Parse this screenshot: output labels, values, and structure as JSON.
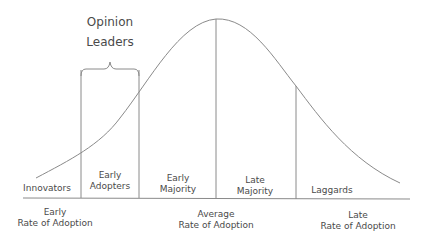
{
  "diagram": {
    "colors": {
      "line": "#8a8a8a",
      "text": "#4a4a4a",
      "background": "#ffffff"
    },
    "bracket": {
      "label_line1": "Opinion",
      "label_line2": "Leaders"
    },
    "segments": [
      {
        "line1": "Innovators",
        "line2": ""
      },
      {
        "line1": "Early",
        "line2": "Adopters"
      },
      {
        "line1": "Early",
        "line2": "Majority"
      },
      {
        "line1": "Late",
        "line2": "Majority"
      },
      {
        "line1": "Laggards",
        "line2": ""
      }
    ],
    "axis_labels": [
      {
        "line1": "Early",
        "line2": "Rate of Adoption"
      },
      {
        "line1": "Average",
        "line2": "Rate of Adoption"
      },
      {
        "line1": "Late",
        "line2": "Rate of Adoption"
      }
    ]
  }
}
